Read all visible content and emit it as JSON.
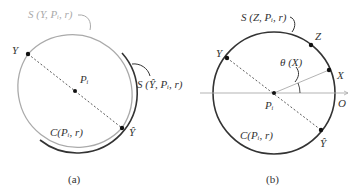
{
  "figure": {
    "panels": [
      {
        "id": "a",
        "caption": "(a)",
        "circle_label": "C(Pᵢ, r)",
        "center_label": "Pᵢ",
        "point_Y": "Y",
        "point_Yhat": "Ŷ",
        "arc_label_light": "S (Y, Pᵢ, r)",
        "arc_label_dark": "S (Ŷ, Pᵢ, r)"
      },
      {
        "id": "b",
        "caption": "(b)",
        "circle_label": "C(Pᵢ, r)",
        "center_label": "Pᵢ",
        "point_Y": "Y",
        "point_Yhat": "Ŷ",
        "point_Z": "Z",
        "point_X": "X",
        "origin_label": "O",
        "angle_label": "θ (X)",
        "arc_label": "S (Z, Pᵢ, r)"
      }
    ],
    "colors": {
      "dark_arc": "#333333",
      "light_arc": "#aaaaaa",
      "axis": "#999999"
    }
  }
}
